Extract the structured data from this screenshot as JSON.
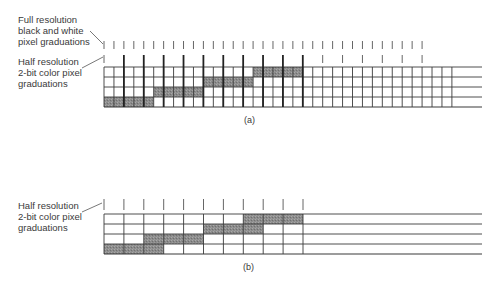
{
  "colors": {
    "line": "#3a3a3a",
    "shade": "#8c8c8c",
    "tick": "#555555"
  },
  "diagram_a": {
    "caption": "(a)",
    "label_full": [
      "Full resolution",
      "black and white",
      "pixel graduations"
    ],
    "label_half": [
      "Half resolution",
      "2-bit color pixel",
      "graduations"
    ],
    "grid": {
      "x0": 104,
      "y0": 67,
      "cell_w": 9.94,
      "cell_h": 10,
      "cols": 35,
      "rows": 4,
      "line_extend_to": 482,
      "shaded": [
        {
          "row": 3,
          "cols": [
            0,
            1,
            2,
            3,
            4
          ]
        },
        {
          "row": 2,
          "cols": [
            5,
            6,
            7,
            8,
            9
          ]
        },
        {
          "row": 1,
          "cols": [
            10,
            11,
            12,
            13,
            14
          ]
        },
        {
          "row": 0,
          "cols": [
            15,
            16,
            17,
            18,
            19
          ]
        }
      ]
    },
    "full_ticks": {
      "count": 33,
      "y1": 41,
      "y2": 49
    },
    "half_ticks": {
      "count": 17,
      "y1": 55,
      "y2_bold": 107,
      "bold_upto": 10
    }
  },
  "diagram_b": {
    "caption": "(b)",
    "label_half": [
      "Half resolution",
      "2-bit color pixel",
      "graduations"
    ],
    "grid": {
      "x0": 104,
      "y0": 214,
      "cell_w": 19.9,
      "cell_h": 10,
      "cols": 10,
      "rows": 4,
      "line_extend_to": 482,
      "shaded": [
        {
          "row": 3,
          "cols": [
            0,
            1,
            2
          ]
        },
        {
          "row": 2,
          "cols": [
            2,
            3,
            4
          ]
        },
        {
          "row": 1,
          "cols": [
            5,
            6,
            7
          ]
        },
        {
          "row": 0,
          "cols": [
            7,
            8,
            9
          ]
        }
      ]
    },
    "half_ticks": {
      "count": 11,
      "y1": 199,
      "y2": 210
    }
  }
}
